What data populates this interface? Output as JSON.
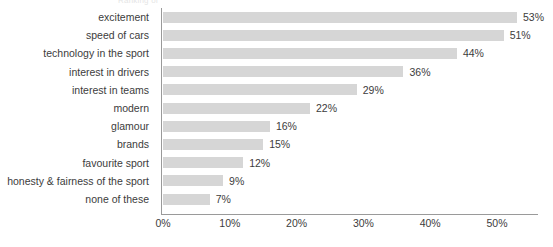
{
  "clipped_caption": "Ranking of",
  "chart_data": {
    "type": "bar",
    "orientation": "horizontal",
    "title": "",
    "subtitle": "",
    "xlabel": "",
    "ylabel": "",
    "grid": false,
    "legend": null,
    "xlim": [
      0,
      56
    ],
    "x_ticks": [
      "0%",
      "10%",
      "20%",
      "30%",
      "40%",
      "50%"
    ],
    "x_tick_values": [
      0,
      10,
      20,
      30,
      40,
      50
    ],
    "bar_color": "#d6d6d6",
    "axis_color": "#9a9a9a",
    "text_color": "#3c3c3c",
    "categories": [
      "excitement",
      "speed of cars",
      "technology in the sport",
      "interest in drivers",
      "interest in teams",
      "modern",
      "glamour",
      "brands",
      "favourite sport",
      "honesty & fairness of the sport",
      "none of these"
    ],
    "values": [
      53,
      51,
      44,
      36,
      29,
      22,
      16,
      15,
      12,
      9,
      7
    ],
    "value_labels": [
      "53%",
      "51%",
      "44%",
      "36%",
      "29%",
      "22%",
      "16%",
      "15%",
      "12%",
      "9%",
      "7%"
    ]
  }
}
